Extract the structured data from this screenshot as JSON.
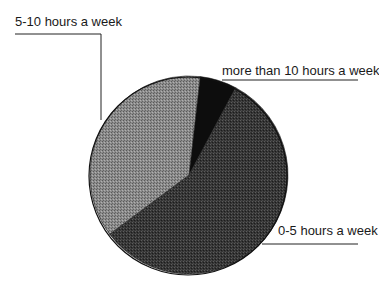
{
  "chart_data": {
    "type": "pie",
    "title": "",
    "categories": [
      "more than 10 hours a week",
      "0-5 hours a week",
      "5-10 hours a week"
    ],
    "values": [
      6,
      57,
      37
    ],
    "unit": "percent (estimated from slice angles)",
    "start_angle_deg": 6.5,
    "direction": "clockwise",
    "colors": [
      "#0d0d0d",
      "#3a3a3a",
      "#8a8a8a"
    ],
    "legend": "none (leader-line labels)",
    "labels": [
      {
        "text": "5-10 hours a week",
        "slice": "5-10 hours a week"
      },
      {
        "text": "more than 10 hours a week",
        "slice": "more than 10 hours a week"
      },
      {
        "text": "0-5 hours a week",
        "slice": "0-5 hours a week"
      }
    ]
  },
  "labels": {
    "five_to_ten": "5-10 hours a week",
    "more_than_ten": "more than 10 hours a week",
    "zero_to_five": "0-5 hours a week"
  }
}
